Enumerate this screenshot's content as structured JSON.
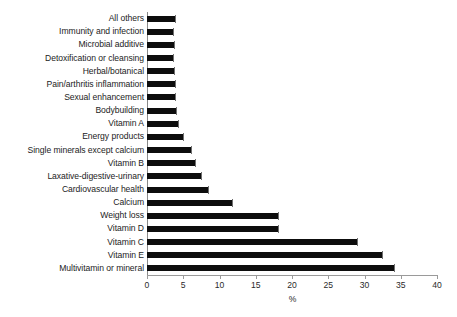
{
  "chart_data": {
    "type": "bar",
    "orientation": "horizontal",
    "title": "",
    "xlabel": "%",
    "ylabel": "",
    "xlim": [
      0,
      40
    ],
    "xticks": [
      0,
      5,
      10,
      15,
      20,
      25,
      30,
      35,
      40
    ],
    "grid": false,
    "legend": null,
    "bar_color": "#0d0d0d",
    "categories": [
      "All others",
      "Immunity and infection",
      "Microbial additive",
      "Detoxification or cleansing",
      "Herbal/botanical",
      "Pain/arthritis inflammation",
      "Sexual enhancement",
      "Bodybuilding",
      "Vitamin A",
      "Energy products",
      "Single minerals except calcium",
      "Vitamin B",
      "Laxative-digestive-urinary",
      "Cardiovascular health",
      "Calcium",
      "Weight loss",
      "Vitamin D",
      "Vitamin C",
      "Vitamin E",
      "Multivitamin or mineral"
    ],
    "values": [
      3.9,
      3.6,
      3.7,
      3.6,
      3.7,
      3.8,
      3.9,
      4.0,
      4.3,
      5.0,
      6.0,
      6.6,
      7.5,
      8.4,
      11.7,
      18.0,
      18.0,
      29.0,
      32.4,
      34.0
    ]
  }
}
